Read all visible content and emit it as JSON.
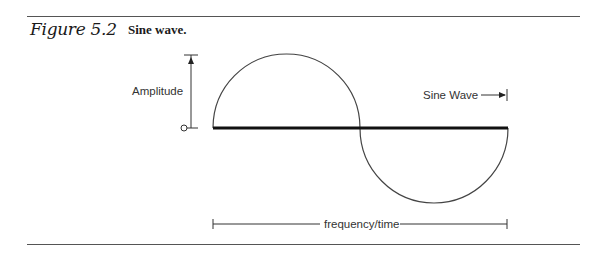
{
  "figure": {
    "number_label": "Figure 5.2",
    "caption": "Sine wave."
  },
  "diagram": {
    "labels": {
      "amplitude": "Amplitude",
      "sine_wave": "Sine Wave",
      "frequency_time": "frequency/time"
    },
    "colors": {
      "line": "#333333",
      "baseline": "#111111",
      "rule": "#555555",
      "text": "#333333"
    }
  }
}
